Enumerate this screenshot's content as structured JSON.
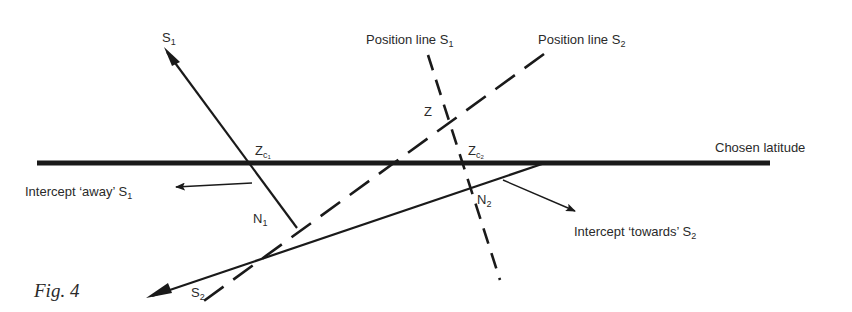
{
  "figure": {
    "caption": "Fig. 4",
    "labels": {
      "s1_arrow": {
        "base": "S",
        "sub": "1"
      },
      "s2_arrow": {
        "base": "S",
        "sub": "2"
      },
      "position_line_s1": {
        "base": "Position line S",
        "sub": "1"
      },
      "position_line_s2": {
        "base": "Position line S",
        "sub": "2"
      },
      "z": "Z",
      "zc1": {
        "base": "Z",
        "sub": "c",
        "subsub": "1"
      },
      "zc2": {
        "base": "Z",
        "sub": "c",
        "subsub": "2"
      },
      "chosen_latitude": "Chosen latitude",
      "n1": {
        "base": "N",
        "sub": "1"
      },
      "n2": {
        "base": "N",
        "sub": "2"
      },
      "intercept_away": {
        "base": "Intercept ‘away’ S",
        "sub": "1"
      },
      "intercept_towards": {
        "base": "Intercept ‘towards’ S",
        "sub": "2"
      }
    },
    "colors": {
      "ink": "#1a1a1a",
      "background": "#ffffff"
    }
  }
}
